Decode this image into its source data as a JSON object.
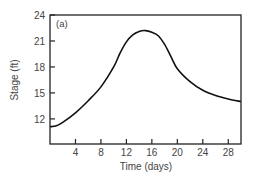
{
  "chart_data": {
    "type": "line",
    "title": "",
    "panel_label": "(a)",
    "xlabel": "Time (days)",
    "ylabel": "Stage (ft)",
    "xlim": [
      0,
      30
    ],
    "ylim": [
      9.1,
      24
    ],
    "xticks": [
      4,
      8,
      12,
      16,
      20,
      24,
      28
    ],
    "yticks": [
      12,
      15,
      18,
      21,
      24
    ],
    "grid": false,
    "legend": null,
    "series": [
      {
        "name": "Stage",
        "x": [
          0,
          1,
          2,
          4,
          6,
          8,
          10,
          11,
          12,
          13,
          14,
          15,
          16,
          17,
          18,
          19,
          20,
          22,
          24,
          26,
          28,
          30
        ],
        "y": [
          11.1,
          11.2,
          11.6,
          12.7,
          14.1,
          15.7,
          18.0,
          19.6,
          20.9,
          21.7,
          22.1,
          22.2,
          22.0,
          21.6,
          20.6,
          19.2,
          17.8,
          16.3,
          15.3,
          14.7,
          14.3,
          14.0
        ]
      }
    ]
  }
}
